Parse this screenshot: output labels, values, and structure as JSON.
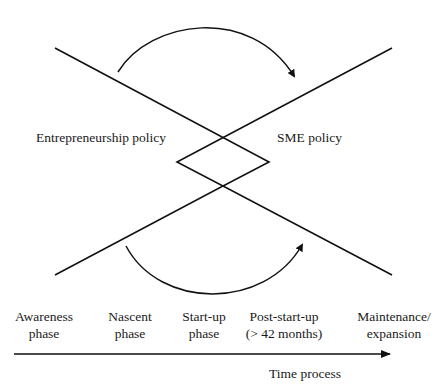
{
  "diagram": {
    "policies": {
      "left": "Entrepreneurship policy",
      "right": "SME policy"
    },
    "phases": [
      {
        "line1": "Awareness",
        "line2": "phase"
      },
      {
        "line1": "Nascent",
        "line2": "phase"
      },
      {
        "line1": "Start-up",
        "line2": "phase"
      },
      {
        "line1": "Post-start-up",
        "line2": "(> 42 months)"
      },
      {
        "line1": "Maintenance/",
        "line2": "expansion"
      }
    ],
    "axis_label": "Time process",
    "colors": {
      "stroke": "#111111",
      "text": "#1a1a1a",
      "background": "#ffffff"
    }
  }
}
